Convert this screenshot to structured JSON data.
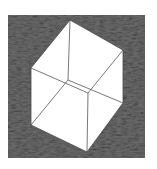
{
  "figure": {
    "colors": {
      "page_background": "#ffffff",
      "square_fill": "#6e6e6e",
      "square_texture_light": "#9a9a9a",
      "square_texture_dark": "#3c3c3c",
      "cube_fill": "#ffffff",
      "cube_edge": "#555555"
    },
    "square": {
      "x": 8,
      "y": 15,
      "width": 137,
      "height": 143
    },
    "cube": {
      "outline": [
        [
          70,
          20
        ],
        [
          123,
          50
        ],
        [
          123,
          103
        ],
        [
          87,
          152
        ],
        [
          31,
          125
        ],
        [
          31,
          68
        ]
      ],
      "inner_vertices": {
        "back": [
          68,
          80
        ],
        "front": [
          88,
          93
        ]
      },
      "edges": [
        [
          [
            70,
            20
          ],
          [
            68,
            80
          ]
        ],
        [
          [
            68,
            80
          ],
          [
            31,
            125
          ]
        ],
        [
          [
            68,
            80
          ],
          [
            123,
            103
          ]
        ],
        [
          [
            31,
            68
          ],
          [
            88,
            93
          ]
        ],
        [
          [
            88,
            93
          ],
          [
            123,
            50
          ]
        ],
        [
          [
            88,
            93
          ],
          [
            87,
            152
          ]
        ]
      ]
    }
  }
}
